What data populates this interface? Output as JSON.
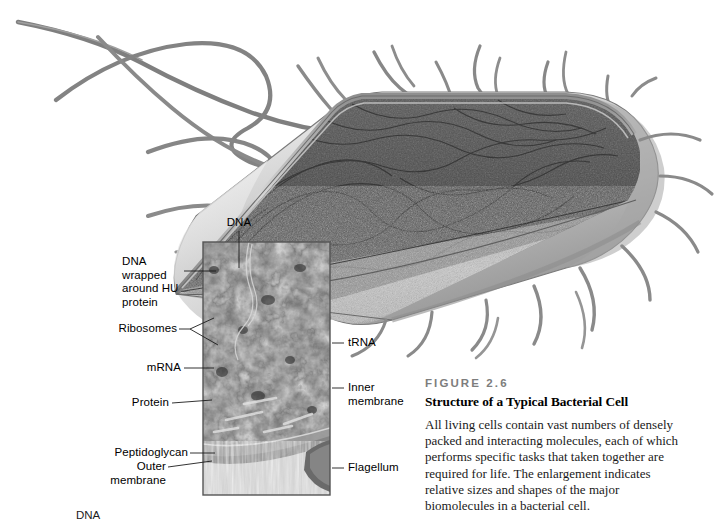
{
  "figure": {
    "number": "FIGURE 2.6",
    "title": "Structure of a Typical Bacterial Cell",
    "body": "All living cells contain vast numbers of densely packed and interacting molecules, each of which performs specific tasks that taken together are required for life. The enlargement indicates relative sizes and shapes of the major biomolecules in a bacterial cell."
  },
  "callouts": {
    "dna_top": "DNA",
    "dna_wrapped": "DNA wrapped\naround HU\nprotein",
    "ribosomes": "Ribosomes",
    "mrna": "mRNA",
    "protein": "Protein",
    "peptidoglycan": "Peptidoglycan",
    "outer_membrane": "Outer\nmembrane",
    "trna": "tRNA",
    "inner_membrane": "Inner\nmembrane",
    "flagellum": "Flagellum"
  },
  "page_fragment": {
    "next_figure_label": "DNA"
  },
  "palette": {
    "background": "#ffffff",
    "cell_envelope_light": "#d8d8d8",
    "cell_envelope_mid": "#a9a9a9",
    "cell_envelope_dark": "#6e6e6e",
    "cytoplasm_dark": "#4a4a4a",
    "cytoplasm_granular": "#b5b5b5",
    "flagella": "#8a8a8a",
    "inset_dark": "#3c3c3c",
    "inset_mid": "#8f8f8f",
    "inset_light": "#d2d2d2",
    "leader_line": "#1c1c1c",
    "caption_figno": "#7d7d7d",
    "text": "#000000"
  },
  "inset": {
    "x": 203,
    "y": 242,
    "width": 127,
    "height": 253,
    "border_color": "#555555"
  }
}
